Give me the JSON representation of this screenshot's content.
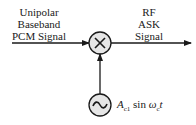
{
  "input_label": [
    "Unipolar",
    "Baseband",
    "PCM Signal"
  ],
  "output_label": [
    "RF",
    "ASK",
    "Signal"
  ],
  "multiplier_symbol": "×",
  "oscillator_symbol": "~",
  "oscillator_formula": {
    "amplitude": "A",
    "amplitude_sub": "c1",
    "func": "sin",
    "omega": "ω",
    "omega_sub": "c",
    "t": "t"
  },
  "colors": {
    "stroke": "#1a1a1a",
    "circle_fill": "#e6e6e6"
  }
}
